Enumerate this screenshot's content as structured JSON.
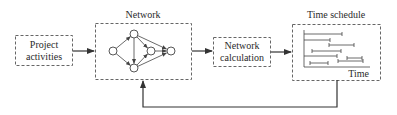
{
  "diagram": {
    "type": "flowchart",
    "nodes": [
      {
        "id": "project_activities",
        "line1": "Project",
        "line2": "activities"
      },
      {
        "id": "network",
        "title": "Network"
      },
      {
        "id": "network_calculation",
        "line1": "Network",
        "line2": "calculation"
      },
      {
        "id": "time_schedule",
        "title": "Time schedule",
        "axis_label": "Time"
      }
    ],
    "edges": [
      {
        "from": "project_activities",
        "to": "network"
      },
      {
        "from": "network",
        "to": "network_calculation"
      },
      {
        "from": "network_calculation",
        "to": "time_schedule"
      },
      {
        "from": "time_schedule",
        "to": "network",
        "kind": "feedback"
      }
    ],
    "network_graph": {
      "node_count": 5,
      "edges": [
        [
          "left",
          "top"
        ],
        [
          "left",
          "bottom"
        ],
        [
          "top",
          "bottom"
        ],
        [
          "top",
          "middle"
        ],
        [
          "top",
          "right"
        ],
        [
          "bottom",
          "middle"
        ],
        [
          "bottom",
          "right"
        ],
        [
          "middle",
          "right"
        ]
      ]
    },
    "gantt_bars": 8
  },
  "colors": {
    "stroke": "#555555",
    "line": "#333333",
    "text": "#2a2a2a"
  }
}
